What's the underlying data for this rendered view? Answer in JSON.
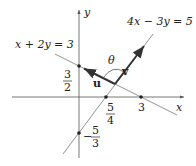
{
  "diagram": {
    "axes": {
      "x_label": "x",
      "y_label": "y"
    },
    "lines": [
      {
        "equation": "x + 2y = 3",
        "x_intercept": "3",
        "y_intercept": "3/2"
      },
      {
        "equation": "4x − 3y = 5",
        "x_intercept": "5/4",
        "y_intercept": "−5/3"
      }
    ],
    "vectors": [
      {
        "name": "u",
        "along": "x + 2y = 3"
      },
      {
        "name": "v",
        "along": "4x − 3y = 5"
      }
    ],
    "angle_label": "θ",
    "intercept_labels": {
      "y_three_halves": {
        "num": "3",
        "den": "2"
      },
      "x_five_quarters": {
        "num": "5",
        "den": "4"
      },
      "x_three": "3",
      "y_neg_five_thirds": {
        "sign": "−",
        "num": "5",
        "den": "3"
      }
    },
    "colors": {
      "axis": "#555555",
      "line": "#777777",
      "vector": "#333333",
      "text": "#222222"
    }
  }
}
